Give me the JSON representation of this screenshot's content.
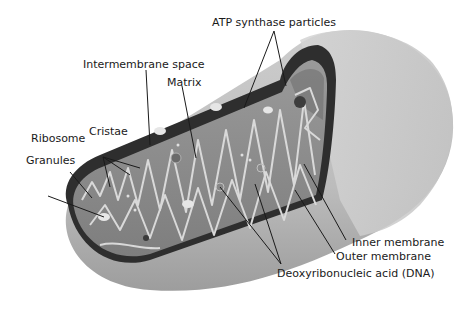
{
  "diagram": {
    "labels": {
      "atp_synthase": "ATP synthase particles",
      "intermembrane_space": "Intermembrane space",
      "matrix": "Matrix",
      "ribosome": "Ribosome",
      "cristae": "Cristae",
      "granules": "Granules",
      "inner_membrane": "Inner membrane",
      "outer_membrane": "Outer membrane",
      "dna": "Deoxyribonucleic acid (DNA)"
    },
    "colors": {
      "outer_shell": "#bdbdbd",
      "outer_shell_light": "#cfcfcf",
      "intermembrane": "#2e2e2e",
      "matrix": "#8c8c8c",
      "cristae_outline": "#d9d9d9",
      "leader_line": "#1a1a1a"
    }
  }
}
